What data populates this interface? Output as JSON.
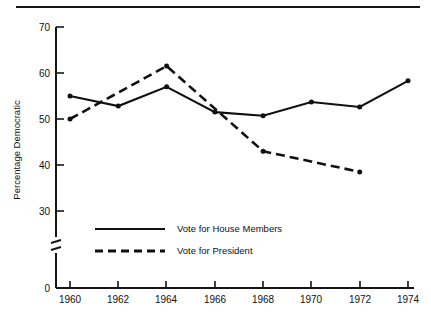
{
  "figure": {
    "top_rule": true,
    "ylabel": "Percentage Democratic"
  },
  "chart_data": {
    "type": "line",
    "title": "",
    "subtitle": "",
    "xlabel": "",
    "ylabel": "Percentage Democratic",
    "x": [
      1960,
      1962,
      1964,
      1966,
      1968,
      1970,
      1972,
      1974
    ],
    "categories": [
      "1960",
      "1962",
      "1964",
      "1966",
      "1968",
      "1970",
      "1972",
      "1974"
    ],
    "xlim": [
      1960,
      1974
    ],
    "ylim": [
      0,
      70
    ],
    "yticks": [
      0,
      30,
      40,
      50,
      60,
      70
    ],
    "ytick_labels": [
      "0",
      "30",
      "40",
      "50",
      "60",
      "70"
    ],
    "y_axis_break": true,
    "y_axis_break_between": [
      0,
      30
    ],
    "grid": false,
    "legend_position": "inside-lower-left",
    "series": [
      {
        "name": "Vote for House Members",
        "style": "solid",
        "color": "#101010",
        "x": [
          1960,
          1962,
          1964,
          1966,
          1968,
          1970,
          1972,
          1974
        ],
        "values": [
          55.0,
          52.8,
          57.0,
          51.5,
          50.7,
          53.7,
          52.6,
          58.3
        ]
      },
      {
        "name": "Vote for President",
        "style": "dashed",
        "color": "#101010",
        "x": [
          1960,
          1964,
          1968,
          1972
        ],
        "values": [
          50.0,
          61.5,
          43.0,
          38.5
        ]
      }
    ]
  },
  "legend": {
    "items": [
      {
        "label": "Vote for House Members",
        "style": "solid"
      },
      {
        "label": "Vote for President",
        "style": "dashed"
      }
    ]
  }
}
